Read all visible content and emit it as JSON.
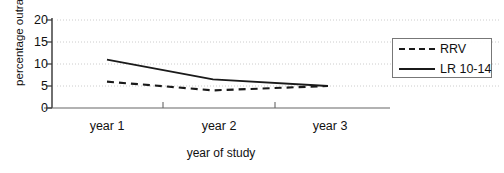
{
  "chart_data": {
    "type": "line",
    "title": "",
    "xlabel": "year of study",
    "ylabel": "percentage outrage",
    "categories": [
      "year 1",
      "year 2",
      "year 3"
    ],
    "xtick_labels": [
      "year 1",
      "year 2",
      "year 3"
    ],
    "ytick_labels": [
      "0",
      "5",
      "10",
      "15",
      "20"
    ],
    "yticks": [
      0,
      5,
      10,
      15,
      20
    ],
    "ylim": [
      0,
      20
    ],
    "grid": "horizontal-dotted",
    "legend_position": "right",
    "series": [
      {
        "name": "RRV",
        "style": "dashed",
        "color": "#1a1a1a",
        "values": [
          6,
          4,
          5
        ]
      },
      {
        "name": "LR 10-14",
        "style": "solid",
        "color": "#1a1a1a",
        "values": [
          11,
          6.5,
          5
        ]
      }
    ]
  },
  "legend": {
    "entries": [
      {
        "label": "RRV",
        "style": "dashed"
      },
      {
        "label": "LR 10-14",
        "style": "solid"
      }
    ]
  },
  "axes": {
    "y_title": "percentage outrage",
    "x_title": "year of study"
  }
}
